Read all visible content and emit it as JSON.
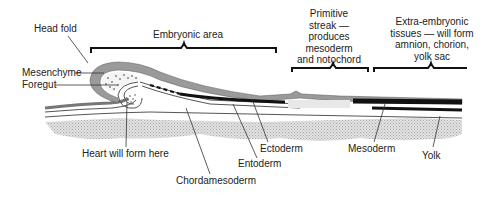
{
  "diagram": {
    "labels": {
      "head_fold": "Head fold",
      "embryonic_area": "Embryonic area",
      "primitive_streak": "Primitive\nstreak —\nproduces\nmesoderm\nand notochord",
      "extra_embryonic": "Extra-embryonic\ntissues — will form\namnion, chorion,\nyolk sac",
      "mesenchyme": "Mesenchyme",
      "foregut": "Foregut",
      "heart": "Heart will form here",
      "ectoderm": "Ectoderm",
      "entoderm": "Entoderm",
      "chordamesoderm": "Chordamesoderm",
      "mesoderm": "Mesoderm",
      "yolk": "Yolk"
    },
    "colors": {
      "ectoderm": "#9a9a9a",
      "mesoderm": "#111111",
      "yolk": "#cfcfcf",
      "line": "#333333"
    }
  }
}
